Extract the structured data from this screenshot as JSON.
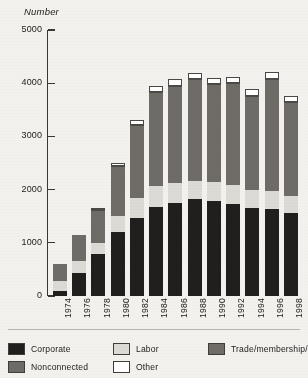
{
  "chart_data": {
    "type": "bar",
    "subtype": "stacked-bar",
    "title": "",
    "ylabel": "Number",
    "xlabel": "",
    "ylim": [
      0,
      5000
    ],
    "yticks": [
      0,
      1000,
      2000,
      3000,
      4000,
      5000
    ],
    "ytick_labels": [
      "0",
      "1000",
      "2000",
      "3000",
      "4000",
      "5000"
    ],
    "grid": false,
    "legend_position": "bottom",
    "categories": [
      "1974",
      "1976",
      "1978",
      "1980",
      "1982",
      "1984",
      "1986",
      "1988",
      "1990",
      "1992",
      "1994",
      "1996",
      "1998"
    ],
    "series": [
      {
        "name": "Corporate",
        "color": "#211f1d",
        "values": [
          89,
          433,
          785,
          1204,
          1469,
          1682,
          1744,
          1816,
          1795,
          1735,
          1660,
          1642,
          1567
        ]
      },
      {
        "name": "Labor",
        "color": "#dcdad5",
        "values": [
          201,
          224,
          217,
          297,
          380,
          394,
          384,
          354,
          346,
          347,
          333,
          332,
          321
        ]
      },
      {
        "name": "Trade/membership/health",
        "color": "#6f6c68",
        "values": [
          318,
          489,
          453,
          574,
          649,
          698,
          745,
          786,
          774,
          770,
          792,
          838,
          825
        ]
      },
      {
        "name": "Nonconnected",
        "color": "#6f6c68",
        "values": [
          0,
          0,
          165,
          374,
          723,
          1053,
          1077,
          1115,
          1062,
          1145,
          980,
          1259,
          935
        ]
      },
      {
        "name": "Other",
        "color": "#ffffff",
        "values": [
          0,
          0,
          34,
          60,
          94,
          125,
          132,
          126,
          125,
          120,
          124,
          131,
          120
        ]
      }
    ],
    "totals": [
      608,
      1146,
      1654,
      2509,
      3315,
      3952,
      4082,
      4197,
      4102,
      4117,
      3889,
      4202,
      3768
    ]
  },
  "legend": {
    "items": [
      {
        "label": "Corporate",
        "swatch": "#211f1d",
        "column": 0,
        "row": 0
      },
      {
        "label": "Nonconnected",
        "swatch": "#6f6c68",
        "column": 0,
        "row": 1
      },
      {
        "label": "Labor",
        "swatch": "#dcdad5",
        "column": 1,
        "row": 0
      },
      {
        "label": "Other",
        "swatch": "#ffffff",
        "column": 1,
        "row": 1
      },
      {
        "label": "Trade/membership/health",
        "swatch": "#6f6c68",
        "column": 2,
        "row": 0
      }
    ]
  }
}
